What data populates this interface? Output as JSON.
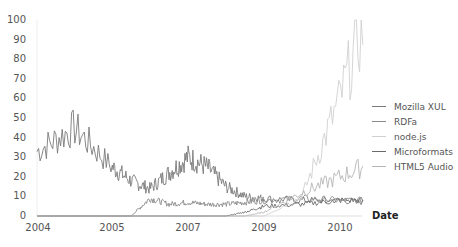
{
  "chart_data": {
    "type": "line",
    "title": "",
    "xlabel": "Date",
    "ylabel": "",
    "ylim": [
      0,
      100
    ],
    "yticks": [
      0,
      10,
      20,
      30,
      40,
      50,
      60,
      70,
      80,
      90,
      100
    ],
    "xticks": [
      "2004",
      "2005",
      "2007",
      "2009",
      "2010"
    ],
    "legend_position": "right",
    "grid": false,
    "x": [
      2004.0,
      2004.5,
      2005.0,
      2005.5,
      2006.0,
      2006.5,
      2007.0,
      2007.5,
      2008.0,
      2008.5,
      2009.0,
      2009.5,
      2010.0,
      2010.3
    ],
    "series": [
      {
        "name": "Mozilla XUL",
        "color": "#7a7a7a",
        "values": [
          33,
          45,
          25,
          18,
          14,
          22,
          30,
          25,
          15,
          10,
          9,
          8,
          8,
          7
        ]
      },
      {
        "name": "RDFa",
        "color": "#8a8a8a",
        "values": [
          0,
          0,
          0,
          0,
          9,
          6,
          7,
          6,
          6,
          7,
          8,
          9,
          8,
          8
        ]
      },
      {
        "name": "node.js",
        "color": "#d0d0d0",
        "values": [
          0,
          0,
          0,
          0,
          0,
          0,
          0,
          0,
          0,
          0,
          0,
          10,
          60,
          97
        ]
      },
      {
        "name": "Microformats",
        "color": "#6a6a6a",
        "values": [
          0,
          0,
          0,
          0,
          0,
          0,
          0,
          0,
          0,
          2,
          5,
          6,
          8,
          8
        ]
      },
      {
        "name": "HTML5 Audio",
        "color": "#b5b5b5",
        "values": [
          0,
          0,
          0,
          0,
          0,
          0,
          0,
          0,
          0,
          0,
          2,
          12,
          20,
          25
        ]
      }
    ]
  },
  "axis": {
    "y_labels": [
      "0",
      "10",
      "20",
      "30",
      "40",
      "50",
      "60",
      "70",
      "80",
      "90",
      "100"
    ],
    "x_labels": [
      "2004",
      "2005",
      "2007",
      "2009",
      "2010"
    ],
    "x_title": "Date"
  },
  "legend": {
    "items": [
      {
        "label": "Mozilla XUL",
        "color": "#7a7a7a"
      },
      {
        "label": "RDFa",
        "color": "#8a8a8a"
      },
      {
        "label": "node.js",
        "color": "#d0d0d0"
      },
      {
        "label": "Microformats",
        "color": "#6a6a6a"
      },
      {
        "label": "HTML5 Audio",
        "color": "#b5b5b5"
      }
    ]
  }
}
